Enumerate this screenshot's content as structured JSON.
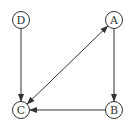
{
  "diagram": {
    "type": "directed-graph",
    "colors": {
      "stroke": "#333333",
      "background": "#ffffff"
    },
    "nodes": [
      {
        "id": "A",
        "label": "A",
        "x": 114,
        "y": 20
      },
      {
        "id": "B",
        "label": "B",
        "x": 114,
        "y": 110
      },
      {
        "id": "C",
        "label": "C",
        "x": 21,
        "y": 110
      },
      {
        "id": "D",
        "label": "D",
        "x": 21,
        "y": 20
      }
    ],
    "node_radius": 8.5,
    "edges": [
      {
        "from": "D",
        "to": "C",
        "bidirectional": false
      },
      {
        "from": "A",
        "to": "B",
        "bidirectional": false
      },
      {
        "from": "B",
        "to": "C",
        "bidirectional": false
      },
      {
        "from": "A",
        "to": "C",
        "bidirectional": true
      }
    ]
  }
}
